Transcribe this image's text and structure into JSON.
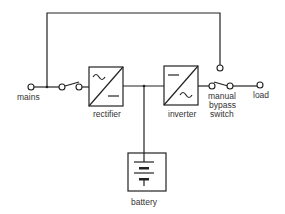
{
  "diagram": {
    "type": "UPS block diagram",
    "labels": {
      "mains": "mains",
      "rectifier": "rectifier",
      "inverter": "inverter",
      "battery": "battery",
      "switch_line1": "manual",
      "switch_line2": "bypass",
      "switch_line3": "switch",
      "load": "load"
    },
    "components": [
      {
        "id": "mains",
        "kind": "terminal"
      },
      {
        "id": "input-switch",
        "kind": "switch"
      },
      {
        "id": "rectifier",
        "kind": "block",
        "symbol": "AC to DC"
      },
      {
        "id": "inverter",
        "kind": "block",
        "symbol": "DC to AC"
      },
      {
        "id": "battery",
        "kind": "block",
        "symbol": "battery cells"
      },
      {
        "id": "manual-bypass-switch",
        "kind": "changeover switch"
      },
      {
        "id": "load",
        "kind": "terminal"
      }
    ],
    "connections": [
      [
        "mains",
        "input-switch"
      ],
      [
        "input-switch",
        "rectifier"
      ],
      [
        "rectifier",
        "inverter"
      ],
      [
        "rectifier-inverter-junction",
        "battery"
      ],
      [
        "inverter",
        "manual-bypass-switch"
      ],
      [
        "mains",
        "manual-bypass-switch (bypass line)"
      ],
      [
        "manual-bypass-switch",
        "load"
      ]
    ]
  }
}
